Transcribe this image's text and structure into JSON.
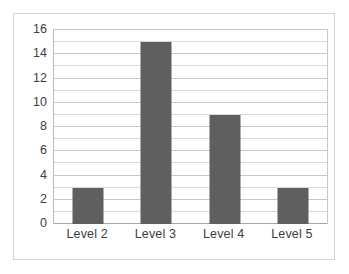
{
  "chart_data": {
    "type": "bar",
    "title": "",
    "subtitle": "",
    "xlabel": "",
    "ylabel": "",
    "categories": [
      "Level 2",
      "Level 3",
      "Level 4",
      "Level 5"
    ],
    "values": [
      3,
      15,
      9,
      3
    ],
    "series": [
      {
        "name": "",
        "values": [
          3,
          15,
          9,
          3
        ]
      }
    ],
    "ylim": [
      0,
      16
    ],
    "y_ticks": [
      0,
      2,
      4,
      6,
      8,
      10,
      12,
      14,
      16
    ],
    "y_tick_labels": [
      "0",
      "2",
      "4",
      "6",
      "8",
      "10",
      "12",
      "14",
      "16"
    ],
    "y_minor_step": 1,
    "grid": true,
    "grid_axis": "y",
    "legend": false,
    "legend_position": "none",
    "annotations": [],
    "colors": {
      "bar": "#5f5f5f",
      "gridline": "#d9d9d9",
      "gridline_major": "#c8c8c8",
      "axis": "#a8a8a8",
      "border": "#d3d3d3",
      "background": "#ffffff",
      "tick_text": "#404040"
    }
  }
}
